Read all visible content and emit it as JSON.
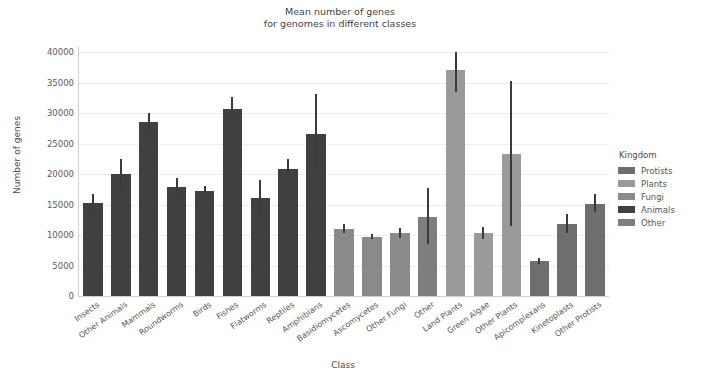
{
  "chart_data": {
    "type": "bar",
    "title": "Mean number of genes\nfor genomes in different classes",
    "xlabel": "Class",
    "ylabel": "Number of genes",
    "ylim": [
      0,
      41000
    ],
    "yticks": [
      0,
      5000,
      10000,
      15000,
      20000,
      25000,
      30000,
      35000,
      40000
    ],
    "ytick_labels": [
      "0",
      "5000",
      "10000",
      "15000",
      "20000",
      "25000",
      "30000",
      "35000",
      "40000"
    ],
    "grid": true,
    "legend_position": "right",
    "legend_title": "Kingdom",
    "categories": [
      "Insects",
      "Other Animals",
      "Mammals",
      "Roundworms",
      "Birds",
      "Fishes",
      "Flatworms",
      "Reptiles",
      "Amphibians",
      "Basidiomycetes",
      "Ascomycetes",
      "Other Fungi",
      "Other",
      "Land Plants",
      "Green Algae",
      "Other Plants",
      "Apicomplexans",
      "Kinetoplasts",
      "Other Protists"
    ],
    "values": [
      15300,
      20000,
      28600,
      17900,
      17300,
      30700,
      16000,
      20900,
      26500,
      11000,
      9700,
      10300,
      13000,
      37000,
      10300,
      23300,
      5800,
      11800,
      15100
    ],
    "error_low": [
      14100,
      17600,
      27300,
      16500,
      16600,
      28900,
      12900,
      19300,
      21200,
      10300,
      9300,
      9500,
      8600,
      33400,
      9400,
      11500,
      5200,
      10300,
      13700
    ],
    "error_high": [
      16700,
      22500,
      30000,
      19400,
      18000,
      32700,
      19100,
      22500,
      33100,
      11800,
      10100,
      11200,
      17700,
      40000,
      11300,
      35300,
      6300,
      13400,
      16700
    ],
    "bar_kingdom": [
      "Animals",
      "Animals",
      "Animals",
      "Animals",
      "Animals",
      "Animals",
      "Animals",
      "Animals",
      "Animals",
      "Fungi",
      "Fungi",
      "Fungi",
      "Other",
      "Plants",
      "Plants",
      "Plants",
      "Protists",
      "Protists",
      "Protists"
    ],
    "kingdom_colors": {
      "Protists": "#6e6e6e",
      "Plants": "#9a9a9a",
      "Fungi": "#8a8a8a",
      "Animals": "#404040",
      "Other": "#7e7e7e"
    },
    "legend_entries": [
      {
        "label": "Protists",
        "color": "#6e6e6e"
      },
      {
        "label": "Plants",
        "color": "#9a9a9a"
      },
      {
        "label": "Fungi",
        "color": "#8a8a8a"
      },
      {
        "label": "Animals",
        "color": "#404040"
      },
      {
        "label": "Other",
        "color": "#7e7e7e"
      }
    ],
    "errorbar_color": "#3a3a3a",
    "grid_color": "#ededed",
    "background_color": "#ffffff"
  }
}
